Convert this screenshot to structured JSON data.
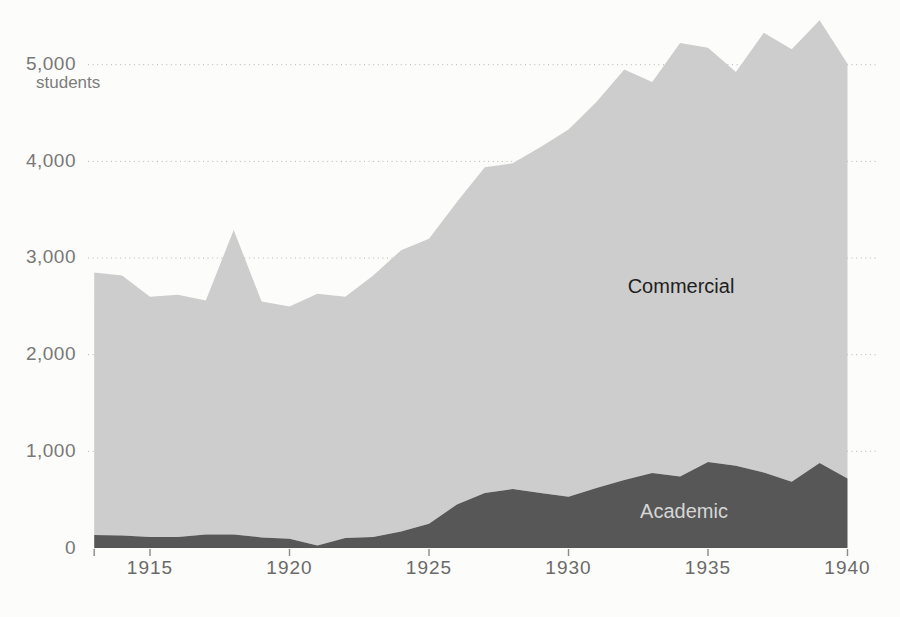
{
  "page": {
    "background": "#fcfcfa",
    "description_note": ""
  },
  "chart_data": {
    "type": "area",
    "stacked": true,
    "title": "",
    "xlabel": "",
    "ylabel": "",
    "y_unit": "students",
    "grid": "dotted horizontal gridlines",
    "legend_position": "labels inside areas",
    "xlim": [
      1913,
      1940
    ],
    "ylim": [
      0,
      5600
    ],
    "x": [
      1913,
      1914,
      1915,
      1916,
      1917,
      1918,
      1919,
      1920,
      1921,
      1922,
      1923,
      1924,
      1925,
      1926,
      1927,
      1928,
      1929,
      1930,
      1931,
      1932,
      1933,
      1934,
      1935,
      1936,
      1937,
      1938,
      1939,
      1940
    ],
    "x_ticks": [
      1915,
      1920,
      1925,
      1930,
      1935,
      1940
    ],
    "x_tick_labels": [
      "1915",
      "1920",
      "1925",
      "1930",
      "1935",
      "1940"
    ],
    "y_ticks": [
      0,
      1000,
      2000,
      3000,
      4000,
      5000
    ],
    "y_tick_labels": [
      "0",
      "1,000",
      "2,000",
      "3,000",
      "4,000",
      "5,000"
    ],
    "series": [
      {
        "name": "Academic",
        "color": "#575757",
        "label_color": "#d6d6d6",
        "values": [
          135,
          130,
          115,
          115,
          140,
          140,
          110,
          95,
          25,
          105,
          115,
          170,
          250,
          450,
          570,
          610,
          570,
          530,
          620,
          705,
          775,
          740,
          890,
          850,
          780,
          685,
          880,
          720
        ]
      },
      {
        "name": "Commercial",
        "color": "#cdcdcd",
        "label_color": "#1e1e1e",
        "values": [
          2715,
          2690,
          2485,
          2505,
          2420,
          3150,
          2440,
          2405,
          2605,
          2495,
          2705,
          2910,
          2950,
          3130,
          3370,
          3370,
          3580,
          3800,
          3995,
          4245,
          4045,
          4485,
          4285,
          4075,
          4550,
          4475,
          4580,
          4290
        ]
      }
    ],
    "totals": [
      2850,
      2820,
      2600,
      2620,
      2560,
      3290,
      2550,
      2500,
      2630,
      2600,
      2820,
      3080,
      3200,
      3580,
      3940,
      3980,
      4150,
      4330,
      4615,
      4950,
      4820,
      5225,
      5175,
      4925,
      5330,
      5160,
      5460,
      5010
    ]
  }
}
